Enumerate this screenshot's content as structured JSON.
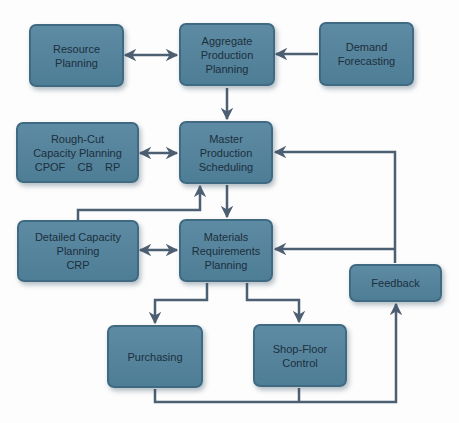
{
  "diagram": {
    "title": "",
    "colors": {
      "box_fill": "#5a879f",
      "box_border": "#3f6a82",
      "arrow": "#4d5f73",
      "text": "#1c2f3c",
      "background": "#fdfdfd"
    },
    "nodes": {
      "resource": {
        "lines": [
          "Resource",
          "Planning"
        ]
      },
      "aggregate": {
        "lines": [
          "Aggregate",
          "Production",
          "Planning"
        ]
      },
      "demand": {
        "lines": [
          "Demand",
          "Forecasting"
        ]
      },
      "roughcut": {
        "lines": [
          "Rough-Cut",
          "Capacity Planning",
          "CPOF    CB    RP"
        ]
      },
      "mps": {
        "lines": [
          "Master",
          "Production",
          "Scheduling"
        ]
      },
      "detailed": {
        "lines": [
          "Detailed Capacity",
          "Planning",
          "CRP"
        ]
      },
      "mrp": {
        "lines": [
          "Materials",
          "Requirements",
          "Planning"
        ]
      },
      "feedback": {
        "lines": [
          "Feedback"
        ]
      },
      "purchasing": {
        "lines": [
          "Purchasing"
        ]
      },
      "shopfloor": {
        "lines": [
          "Shop-Floor",
          "Control"
        ]
      }
    },
    "edges": [
      {
        "from": "resource",
        "to": "aggregate",
        "type": "bidirectional"
      },
      {
        "from": "demand",
        "to": "aggregate",
        "type": "directed"
      },
      {
        "from": "aggregate",
        "to": "mps",
        "type": "directed"
      },
      {
        "from": "roughcut",
        "to": "mps",
        "type": "bidirectional"
      },
      {
        "from": "detailed",
        "to": "mps",
        "type": "directed"
      },
      {
        "from": "mps",
        "to": "mrp",
        "type": "directed"
      },
      {
        "from": "detailed",
        "to": "mrp",
        "type": "bidirectional"
      },
      {
        "from": "mrp",
        "to": "purchasing",
        "type": "directed"
      },
      {
        "from": "mrp",
        "to": "shopfloor",
        "type": "directed"
      },
      {
        "from": "purchasing",
        "to": "feedback",
        "type": "directed"
      },
      {
        "from": "shopfloor",
        "to": "feedback",
        "type": "directed"
      },
      {
        "from": "feedback",
        "to": "mps",
        "type": "directed"
      },
      {
        "from": "feedback",
        "to": "mrp",
        "type": "directed"
      }
    ]
  }
}
